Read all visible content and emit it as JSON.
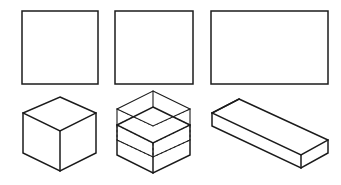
{
  "figure": {
    "background_color": "#ffffff",
    "line_color": "#1b1b1b",
    "hidden_line_color": "#2a2a2a",
    "canvas": {
      "width": 341,
      "height": 185
    },
    "row_labels": {
      "top_row": "elevation views",
      "bottom_row": "isometric views"
    },
    "shapes": [
      {
        "id": "top-left-square",
        "name": "square-outline-left",
        "kind": "rectangle",
        "row": "top",
        "column": 1,
        "x": 22,
        "y": 11,
        "width": 76,
        "height": 73,
        "fill": "#ffffff",
        "stroke": "#1b1b1b",
        "stroke_width": 1.5
      },
      {
        "id": "top-middle-square",
        "name": "square-outline-middle",
        "kind": "rectangle",
        "row": "top",
        "column": 2,
        "x": 115,
        "y": 11,
        "width": 78,
        "height": 73,
        "fill": "#ffffff",
        "stroke": "#1b1b1b",
        "stroke_width": 1.5
      },
      {
        "id": "top-right-rectangle",
        "name": "rectangle-outline-right",
        "kind": "rectangle",
        "row": "top",
        "column": 3,
        "x": 211,
        "y": 11,
        "width": 117,
        "height": 73,
        "fill": "#ffffff",
        "stroke": "#1b1b1b",
        "stroke_width": 1.5
      },
      {
        "id": "bottom-left-cube",
        "name": "isometric-cube",
        "kind": "isometric-box",
        "row": "bottom",
        "column": 1,
        "description": "solid isometric cube with three visible faces",
        "vertices": {
          "top_apex": [
            60,
            97
          ],
          "top_left": [
            23,
            113
          ],
          "top_right": [
            96,
            113
          ],
          "center": [
            60,
            131
          ],
          "bottom_left": [
            23,
            153
          ],
          "bottom_right": [
            96,
            153
          ],
          "bottom_apex": [
            60,
            171
          ]
        }
      },
      {
        "id": "bottom-middle-sliced-cube",
        "name": "isometric-cube-sliced",
        "kind": "isometric-box-layered",
        "row": "bottom",
        "column": 2,
        "description": "isometric cube separated into horizontal layers with hidden construction lines",
        "layer_count": 3,
        "vertices": {
          "top_apex": [
            153,
            91
          ],
          "top_left": [
            117,
            109
          ],
          "top_right": [
            190,
            109
          ],
          "top_center": [
            153,
            126
          ],
          "mid_apex": [
            153,
            107
          ],
          "mid_left": [
            117,
            125
          ],
          "mid_right": [
            190,
            125
          ],
          "mid_center": [
            153,
            142
          ],
          "low_left": [
            117,
            140
          ],
          "low_right": [
            190,
            140
          ],
          "low_apex": [
            153,
            122
          ],
          "low_center": [
            153,
            157
          ],
          "bottom_left": [
            117,
            155
          ],
          "bottom_right": [
            190,
            155
          ],
          "bottom_apex": [
            153,
            173
          ]
        }
      },
      {
        "id": "bottom-right-slab",
        "name": "isometric-slab",
        "kind": "isometric-box",
        "row": "bottom",
        "column": 3,
        "description": "long flat isometric rectangular slab",
        "vertices": {
          "back_left": [
            212,
            113
          ],
          "back_apex": [
            239,
            99
          ],
          "far_right": [
            328,
            140
          ],
          "near_right": [
            301,
            155
          ],
          "front_bottom": [
            301,
            168
          ],
          "right_bottom": [
            328,
            153
          ],
          "left_bottom": [
            212,
            126
          ]
        }
      }
    ]
  }
}
